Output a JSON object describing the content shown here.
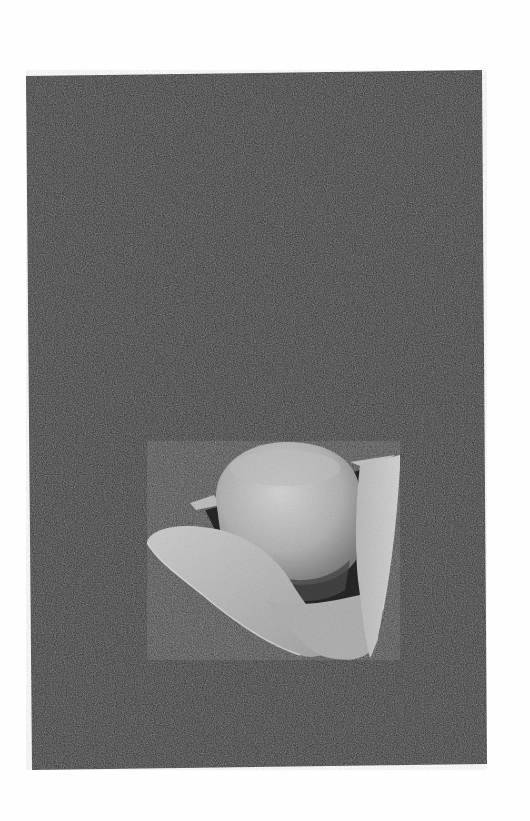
{
  "image": {
    "subject": "Tricorne hat",
    "description": "Grayscale photograph of a felt tricorne hat with upturned brims, shown on a dark speckled background",
    "background_color": "#2b2b2b",
    "page_color": "#fefefe",
    "hat_light_color": "#c9c9c9",
    "hat_mid_color": "#a8a8a8",
    "hat_shadow_color": "#3a3a3a"
  }
}
